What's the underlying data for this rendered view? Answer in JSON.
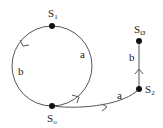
{
  "diagram": {
    "type": "state-transition-diagram",
    "colors": {
      "line": "#555555",
      "node": "#111111",
      "text": "#222222",
      "background": "#ffffff"
    },
    "nodes": [
      {
        "id": "S1",
        "label": "S",
        "subscript": "1",
        "x": 52,
        "y": 26,
        "label_x": 48,
        "label_y": 16
      },
      {
        "id": "S0",
        "label": "S",
        "subscript": "o",
        "x": 52,
        "y": 106,
        "label_x": 48,
        "label_y": 122
      },
      {
        "id": "S2",
        "label": "S",
        "subscript": "2",
        "x": 139,
        "y": 89,
        "label_x": 145,
        "label_y": 93
      },
      {
        "id": "SO",
        "label": "S",
        "subscript": "Ø",
        "x": 139,
        "y": 41,
        "label_x": 135,
        "label_y": 31
      }
    ],
    "edges": [
      {
        "from": "S1",
        "to": "S0",
        "label": "b",
        "path": "left arc of circle",
        "label_x": 18,
        "label_y": 75
      },
      {
        "from": "S0",
        "to": "S1",
        "label": "a",
        "path": "right arc of circle",
        "label_x": 80,
        "label_y": 57
      },
      {
        "from": "S0",
        "to": "S2",
        "label": "a",
        "path": "curve",
        "label_x": 117,
        "label_y": 99
      },
      {
        "from": "S2",
        "to": "SO",
        "label": "b",
        "path": "vertical line",
        "label_x": 129,
        "label_y": 60
      }
    ]
  }
}
